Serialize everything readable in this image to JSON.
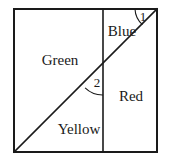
{
  "figure": {
    "type": "geometry-diagram",
    "background_color": "#ffffff",
    "line_color": "#1a1a1a",
    "frame": {
      "left": 14,
      "top": 9,
      "right": 157,
      "bottom": 152,
      "stroke_width": 2
    },
    "diagonal": {
      "name": "diagonal-line",
      "from_x": 14,
      "from_y": 152,
      "to_x": 157,
      "to_y": 9,
      "stroke_width": 1.6
    },
    "vertical": {
      "name": "vertical-line",
      "x": 103,
      "from_y": 9,
      "to_y": 152,
      "stroke_width": 1.6
    },
    "regions": [
      {
        "id": "green",
        "label": "Green",
        "x": 60,
        "y": 62
      },
      {
        "id": "blue",
        "label": "Blue",
        "x": 122,
        "y": 33
      },
      {
        "id": "red",
        "label": "Red",
        "x": 131,
        "y": 98
      },
      {
        "id": "yellow",
        "label": "Yellow",
        "x": 79,
        "y": 131
      }
    ],
    "angles": [
      {
        "id": "angle-1",
        "label": "1",
        "vertex_x": 157,
        "vertex_y": 9,
        "label_x": 143,
        "label_y": 18,
        "arc_d": "M 135 9 A 22 22 0 0 0 142.4 24.6",
        "description": "angle between top edge and diagonal at top-right corner"
      },
      {
        "id": "angle-2",
        "label": "2",
        "vertex_x": 103,
        "vertex_y": 70,
        "label_x": 97,
        "label_y": 84,
        "arc_d": "M 85.1 87.9 A 25 25 0 0 0 103 95",
        "description": "angle between diagonal and vertical line below intersection"
      }
    ]
  }
}
